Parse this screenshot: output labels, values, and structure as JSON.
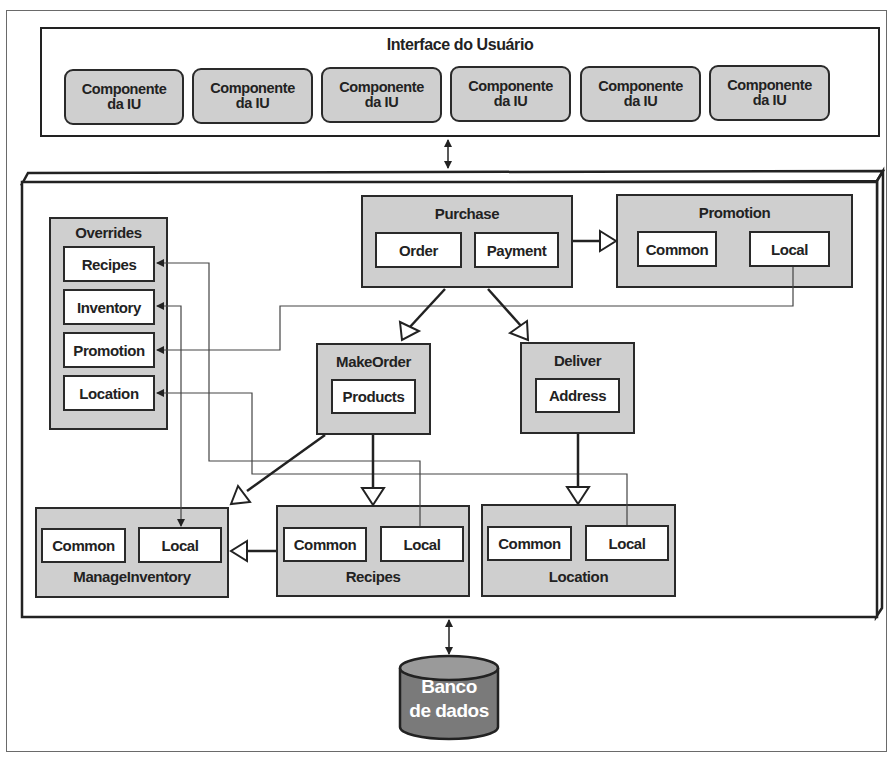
{
  "ui_layer": {
    "title": "Interface do Usuário",
    "components": [
      {
        "line1": "Componente",
        "line2": "da IU"
      },
      {
        "line1": "Componente",
        "line2": "da IU"
      },
      {
        "line1": "Componente",
        "line2": "da IU"
      },
      {
        "line1": "Componente",
        "line2": "da IU"
      },
      {
        "line1": "Componente",
        "line2": "da IU"
      },
      {
        "line1": "Componente",
        "line2": "da IU"
      }
    ]
  },
  "overrides": {
    "title": "Overrides",
    "items": [
      "Recipes",
      "Inventory",
      "Promotion",
      "Location"
    ]
  },
  "modules": {
    "purchase": {
      "title": "Purchase",
      "parts": [
        "Order",
        "Payment"
      ]
    },
    "promotion": {
      "title": "Promotion",
      "parts": [
        "Common",
        "Local"
      ]
    },
    "make_order": {
      "title": "MakeOrder",
      "parts": [
        "Products"
      ]
    },
    "deliver": {
      "title": "Deliver",
      "parts": [
        "Address"
      ]
    },
    "manage_inventory": {
      "title": "ManageInventory",
      "parts": [
        "Common",
        "Local"
      ]
    },
    "recipes": {
      "title": "Recipes",
      "parts": [
        "Common",
        "Local"
      ]
    },
    "location": {
      "title": "Location",
      "parts": [
        "Common",
        "Local"
      ]
    }
  },
  "database": {
    "line1": "Banco",
    "line2": "de dados"
  },
  "colors": {
    "module_fill": "#cfcfcf",
    "stroke": "#2a2a2a",
    "database_fill": "#7a7a7a"
  }
}
